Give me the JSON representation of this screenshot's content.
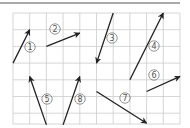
{
  "figure": {
    "type": "vector-grid-diagram",
    "grid": {
      "columns": 10,
      "rows": 7,
      "cell_size_px": 16.7,
      "origin_px": [
        13,
        13
      ],
      "line_color": "#cccccc"
    },
    "top_rule_color": "#555555",
    "arrow_color": "#222222",
    "vectors": [
      {
        "id": 1,
        "label": "①",
        "from": [
          0,
          3
        ],
        "to": [
          1,
          1
        ],
        "label_pos": [
          30,
          47
        ]
      },
      {
        "id": 2,
        "label": "②",
        "from": [
          2,
          2
        ],
        "to": [
          4,
          1.2
        ],
        "label_pos": [
          55,
          29
        ]
      },
      {
        "id": 3,
        "label": "③",
        "from": [
          6,
          0
        ],
        "to": [
          5,
          3
        ],
        "label_pos": [
          112,
          38
        ]
      },
      {
        "id": 4,
        "label": "④",
        "from": [
          7,
          4
        ],
        "to": [
          9,
          0
        ],
        "label_pos": [
          154,
          46
        ]
      },
      {
        "id": 5,
        "label": "⑤",
        "from": [
          2,
          6.7
        ],
        "to": [
          1,
          3.8
        ],
        "label_pos": [
          47,
          99
        ]
      },
      {
        "id": 6,
        "label": "⑥",
        "from": [
          8,
          4.7
        ],
        "to": [
          10,
          3.8
        ],
        "label_pos": [
          154,
          75
        ]
      },
      {
        "id": 7,
        "label": "⑦",
        "from": [
          5,
          4.7
        ],
        "to": [
          8,
          6.6
        ],
        "label_pos": [
          125,
          98
        ]
      },
      {
        "id": 8,
        "label": "⑧",
        "from": [
          3,
          6.7
        ],
        "to": [
          4,
          3.8
        ],
        "label_pos": [
          80,
          99
        ]
      }
    ]
  }
}
